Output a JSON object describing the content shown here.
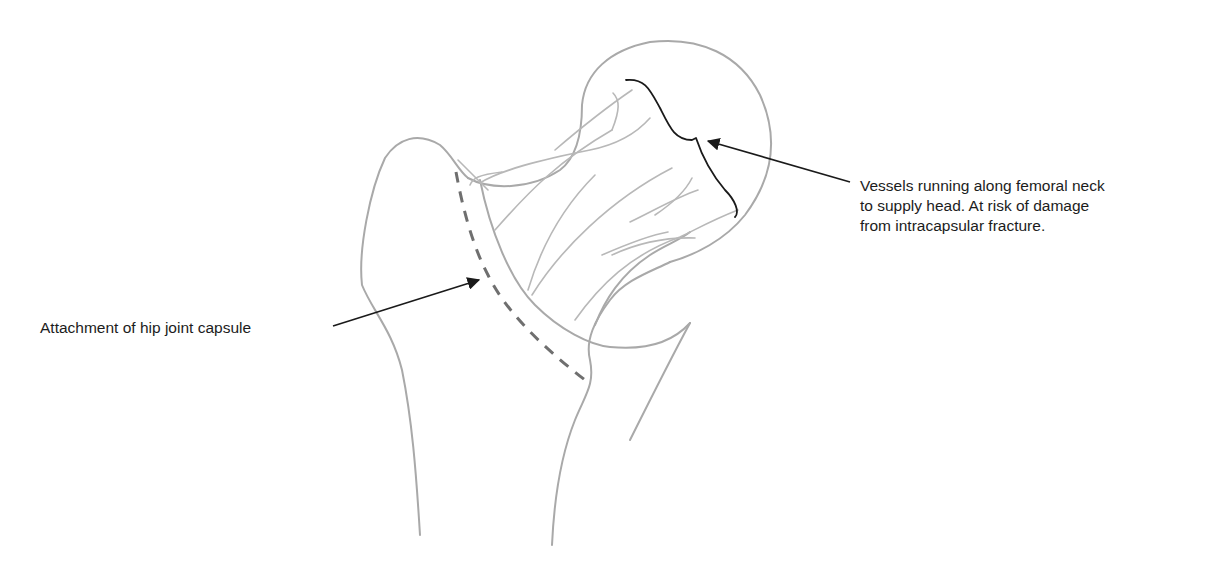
{
  "diagram": {
    "colors": {
      "bone_outline": "#a9a9a9",
      "vessels": "#b8b8b8",
      "capsule_dashed": "#6f6f6f",
      "annotation": "#1a1a1a",
      "background": "#ffffff"
    },
    "labels": {
      "vessels": {
        "line1": "Vessels running along femoral neck",
        "line2": "to supply head. At risk of damage",
        "line3": "from intracapsular fracture."
      },
      "capsule": {
        "text": "Attachment of hip joint capsule"
      }
    },
    "icons": {
      "vessels_pointer": "arrow-icon",
      "capsule_pointer": "arrow-icon",
      "vessels_bracket": "curly-brace-icon"
    }
  }
}
